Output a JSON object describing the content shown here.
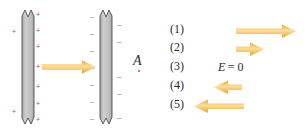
{
  "figure": {
    "type": "physics-diagram",
    "colors": {
      "arrow": "#F0B942",
      "arrow_light": "#FAD98A",
      "plate_fill": "#BFBFBF",
      "plate_edge": "#555555",
      "plus_sign": "#C8423A",
      "minus_sign": "#6D7F8E",
      "text": "#2B2B2B"
    }
  },
  "diagram": {
    "left_plate": {
      "name": "positively-charged-plate",
      "charge_symbol": "+",
      "charge_count": 9
    },
    "right_plate": {
      "name": "negatively-charged-plate",
      "charge_symbol": "–",
      "charge_count": 12
    },
    "field_arrow": {
      "name": "field-arrow-between-plates",
      "direction": "right"
    },
    "point_label": "A"
  },
  "options": {
    "items": [
      {
        "label": "(1)",
        "graphic": "arrow-right-long",
        "text": ""
      },
      {
        "label": "(2)",
        "graphic": "arrow-right-short",
        "text": ""
      },
      {
        "label": "(3)",
        "graphic": "text",
        "text": "E = 0"
      },
      {
        "label": "(4)",
        "graphic": "arrow-left-short",
        "text": ""
      },
      {
        "label": "(5)",
        "graphic": "arrow-left-long",
        "text": ""
      }
    ],
    "e_zero": {
      "symbol": "E",
      "equals": "= 0"
    }
  }
}
